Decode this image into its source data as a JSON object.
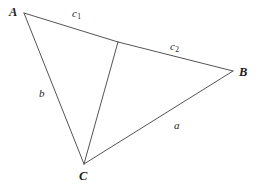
{
  "figure": {
    "kind": "geometry-diagram",
    "canvas": {
      "width": 259,
      "height": 188,
      "background": "#ffffff"
    },
    "style": {
      "stroke_color": "#545454",
      "stroke_width": 1,
      "text_color": "#1b1b1b"
    },
    "points": {
      "A": {
        "label": "A",
        "x": 24,
        "y": 13
      },
      "B": {
        "label": "B",
        "x": 233,
        "y": 71
      },
      "C": {
        "label": "C",
        "x": 84,
        "y": 164
      },
      "D": {
        "label": "",
        "x": 118,
        "y": 42
      }
    },
    "segments": [
      {
        "name": "side-c1",
        "from": "A",
        "to": "D",
        "label": "c",
        "sublabel": "1"
      },
      {
        "name": "side-c2",
        "from": "D",
        "to": "B",
        "label": "c",
        "sublabel": "2"
      },
      {
        "name": "side-a",
        "from": "B",
        "to": "C",
        "label": "a",
        "sublabel": ""
      },
      {
        "name": "side-b",
        "from": "A",
        "to": "C",
        "label": "b",
        "sublabel": ""
      },
      {
        "name": "cevian",
        "from": "C",
        "to": "D",
        "label": "",
        "sublabel": ""
      }
    ],
    "labels": {
      "vertex_a": "A",
      "vertex_b": "B",
      "vertex_c": "C",
      "side_c1_base": "c",
      "side_c1_sub": "1",
      "side_c2_base": "c",
      "side_c2_sub": "2",
      "side_a": "a",
      "side_b": "b"
    }
  }
}
